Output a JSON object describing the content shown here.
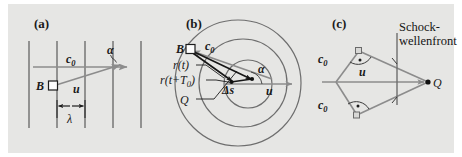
{
  "figure": {
    "background_color": "#e6e6e4",
    "page_color": "#ffffff",
    "line_color": "#6e6e6e",
    "dark_line_color": "#1c1c1c",
    "text_color": "#1a1a1a",
    "width": 462,
    "height": 157
  },
  "panels": {
    "a": {
      "label": "(a)",
      "description": "Plane wavefronts with source B moving at velocity u at angle alpha to wave propagation direction c0; wavelength lambda between adjacent fronts",
      "labels": {
        "c0": "c",
        "c0_sub": "0",
        "source": "B",
        "velocity": "u",
        "angle": "α",
        "wavelength": "λ"
      },
      "wavefront_count": 5
    },
    "b": {
      "label": "(b)",
      "description": "Concentric circular wavefronts emitted by a moving source; position vectors r(t) and r(t+T0) from observer B to source positions separated by displacement delta-s",
      "labels": {
        "c0": "c",
        "c0_sub": "0",
        "observer": "B",
        "r_t": "r(t)",
        "r_t_T0": "r(t+T",
        "r_t_T0_sub": "0",
        "r_t_T0_end": ")",
        "source_point": "Q",
        "displacement": "Δs",
        "velocity": "u",
        "angle": "α"
      },
      "circle_count": 3
    },
    "c": {
      "label": "(c)",
      "description": "Mach cone construction: source Q moving with supersonic velocity u, wave speed c0 perpendicular to the shock wave front",
      "labels": {
        "c0_upper": "c",
        "c0_upper_sub": "0",
        "c0_lower": "c",
        "c0_lower_sub": "0",
        "velocity": "u",
        "source_point": "Q",
        "front_line1": "Schock-",
        "front_line2": "wellenfront"
      },
      "right_angle_marks": 2
    }
  }
}
